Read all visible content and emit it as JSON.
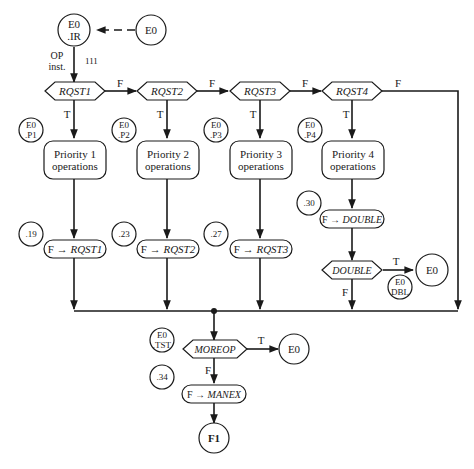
{
  "title_nodes": {
    "entry_ir": {
      "line1": "E0",
      "line2": ".IR"
    },
    "entry_source": {
      "label": "E0"
    },
    "op_label": {
      "line1": "OP",
      "line2": "inst."
    },
    "op_code": "111"
  },
  "decisions": [
    {
      "label": "RQST1",
      "true": "T",
      "false": "F"
    },
    {
      "label": "RQST2",
      "true": "T",
      "false": "F"
    },
    {
      "label": "RQST3",
      "true": "T",
      "false": "F"
    },
    {
      "label": "RQST4",
      "true": "T",
      "false": "F"
    }
  ],
  "connectors": [
    {
      "line1": "E0",
      "line2": ".P1"
    },
    {
      "line1": "E0",
      "line2": ".P2"
    },
    {
      "line1": "E0",
      "line2": ".P3"
    },
    {
      "line1": "E0",
      "line2": ".P4"
    }
  ],
  "operations": [
    {
      "line1": "Priority 1",
      "line2": "operations"
    },
    {
      "line1": "Priority 2",
      "line2": "operations"
    },
    {
      "line1": "Priority 3",
      "line2": "operations"
    },
    {
      "line1": "Priority 4",
      "line2": "operations"
    }
  ],
  "step_labels": [
    ".19",
    ".23",
    ".27",
    ".30"
  ],
  "assignments": [
    {
      "prefix": "F → ",
      "target": "RQST1"
    },
    {
      "prefix": "F → ",
      "target": "RQST2"
    },
    {
      "prefix": "F → ",
      "target": "RQST3"
    },
    {
      "prefix": "F → ",
      "target": "DOUBLE"
    }
  ],
  "double_check": {
    "label": "DOUBLE",
    "true": "T",
    "false": "F",
    "exit": "E0",
    "connector": {
      "line1": "E0",
      "line2": "DBL"
    }
  },
  "moreop": {
    "label": "MOREOP",
    "true": "T",
    "false": "F",
    "exit": "E0",
    "connector": {
      "line1": "E0",
      "line2": ".TST"
    },
    "step": ".34",
    "assign": {
      "prefix": "F → ",
      "target": "MANEX"
    },
    "terminal": "F1"
  }
}
